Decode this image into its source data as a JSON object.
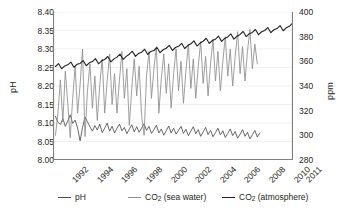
{
  "chart_data": {
    "type": "line",
    "title": "",
    "xlabel": "",
    "ylabel": "pH",
    "ylabel_right": "ppm",
    "ylim": [
      8.0,
      8.4
    ],
    "ylim_right": [
      280,
      400
    ],
    "xlim": [
      1991.5,
      2011.0
    ],
    "grid": true,
    "legend_position": "bottom",
    "xticks": [
      "1992",
      "1994",
      "1996",
      "1998",
      "2000",
      "2002",
      "2004",
      "2006",
      "2008",
      "2010",
      "2011"
    ],
    "xtick_values": [
      1992,
      1994,
      1996,
      1998,
      2000,
      2002,
      2004,
      2006,
      2008,
      2010,
      2011
    ],
    "yticks_left": [
      "8.00",
      "8.05",
      "8.10",
      "8.15",
      "8.20",
      "8.25",
      "8.30",
      "8.35",
      "8.40"
    ],
    "ytick_values_left": [
      8.0,
      8.05,
      8.1,
      8.15,
      8.2,
      8.25,
      8.3,
      8.35,
      8.4
    ],
    "yticks_right": [
      "280",
      "300",
      "320",
      "340",
      "360",
      "380",
      "400"
    ],
    "ytick_values_right": [
      280,
      300,
      320,
      340,
      360,
      380,
      400
    ],
    "series": [
      {
        "name": "pH",
        "axis": "left",
        "color": "#4d4d4d",
        "x": [
          1991.7,
          1991.9,
          1992.1,
          1992.3,
          1992.5,
          1992.7,
          1992.9,
          1993.1,
          1993.3,
          1993.5,
          1993.7,
          1993.9,
          1994.1,
          1994.3,
          1994.5,
          1994.7,
          1994.9,
          1995.1,
          1995.3,
          1995.5,
          1995.7,
          1995.9,
          1996.1,
          1996.3,
          1996.5,
          1996.7,
          1996.9,
          1997.1,
          1997.3,
          1997.5,
          1997.7,
          1997.9,
          1998.1,
          1998.3,
          1998.5,
          1998.7,
          1998.9,
          1999.1,
          1999.3,
          1999.5,
          1999.7,
          1999.9,
          2000.1,
          2000.3,
          2000.5,
          2000.7,
          2000.9,
          2001.1,
          2001.3,
          2001.5,
          2001.7,
          2001.9,
          2002.1,
          2002.3,
          2002.5,
          2002.7,
          2002.9,
          2003.1,
          2003.3,
          2003.5,
          2003.7,
          2003.9,
          2004.1,
          2004.3,
          2004.5,
          2004.7,
          2004.9,
          2005.1,
          2005.3,
          2005.5,
          2005.7,
          2005.9,
          2006.1,
          2006.3,
          2006.5,
          2006.7,
          2006.9,
          2007.1,
          2007.3,
          2007.5,
          2007.7,
          2007.9,
          2008.1,
          2008.3
        ],
        "values": [
          8.118,
          8.102,
          8.096,
          8.112,
          8.091,
          8.105,
          8.122,
          8.099,
          8.108,
          8.086,
          8.052,
          8.088,
          8.116,
          8.103,
          8.09,
          8.078,
          8.093,
          8.081,
          8.097,
          8.074,
          8.086,
          8.1,
          8.078,
          8.091,
          8.073,
          8.086,
          8.097,
          8.079,
          8.088,
          8.071,
          8.083,
          8.095,
          8.076,
          8.09,
          8.075,
          8.086,
          8.098,
          8.08,
          8.091,
          8.072,
          8.082,
          8.094,
          8.073,
          8.084,
          8.067,
          8.079,
          8.092,
          8.073,
          8.086,
          8.07,
          8.08,
          8.091,
          8.072,
          8.083,
          8.066,
          8.078,
          8.09,
          8.071,
          8.082,
          8.064,
          8.076,
          8.088,
          8.069,
          8.08,
          8.063,
          8.074,
          8.086,
          8.068,
          8.079,
          8.061,
          8.072,
          8.084,
          8.066,
          8.077,
          8.059,
          8.07,
          8.082,
          8.064,
          8.075,
          8.057,
          8.068,
          8.08,
          8.062,
          8.073
        ]
      },
      {
        "name": "CO2 (sea water)",
        "axis": "right",
        "color": "#8c8c8c",
        "x": [
          1991.7,
          1991.9,
          1992.1,
          1992.3,
          1992.5,
          1992.7,
          1992.9,
          1993.1,
          1993.3,
          1993.5,
          1993.7,
          1993.9,
          1994.1,
          1994.3,
          1994.5,
          1994.7,
          1994.9,
          1995.1,
          1995.3,
          1995.5,
          1995.7,
          1995.9,
          1996.1,
          1996.3,
          1996.5,
          1996.7,
          1996.9,
          1997.1,
          1997.3,
          1997.5,
          1997.7,
          1997.9,
          1998.1,
          1998.3,
          1998.5,
          1998.7,
          1998.9,
          1999.1,
          1999.3,
          1999.5,
          1999.7,
          1999.9,
          2000.1,
          2000.3,
          2000.5,
          2000.7,
          2000.9,
          2001.1,
          2001.3,
          2001.5,
          2001.7,
          2001.9,
          2002.1,
          2002.3,
          2002.5,
          2002.7,
          2002.9,
          2003.1,
          2003.3,
          2003.5,
          2003.7,
          2003.9,
          2004.1,
          2004.3,
          2004.5,
          2004.7,
          2004.9,
          2005.1,
          2005.3,
          2005.5,
          2005.7,
          2005.9,
          2006.1,
          2006.3,
          2006.5,
          2006.7,
          2006.9,
          2007.1,
          2007.3,
          2007.5,
          2007.7,
          2007.9,
          2008.1
        ],
        "values": [
          300,
          318,
          345,
          311,
          352,
          326,
          298,
          330,
          356,
          318,
          341,
          370,
          299,
          336,
          358,
          322,
          348,
          312,
          341,
          362,
          318,
          344,
          366,
          325,
          350,
          318,
          345,
          368,
          330,
          354,
          308,
          338,
          362,
          332,
          356,
          316,
          300,
          348,
          368,
          330,
          354,
          372,
          318,
          346,
          366,
          334,
          358,
          322,
          350,
          370,
          336,
          360,
          326,
          352,
          374,
          338,
          362,
          330,
          356,
          376,
          342,
          364,
          332,
          358,
          378,
          344,
          368,
          336,
          360,
          380,
          348,
          370,
          340,
          364,
          384,
          350,
          372,
          344,
          368,
          386,
          354,
          374,
          358
        ]
      },
      {
        "name": "CO2 (atmosphere)",
        "axis": "right",
        "color": "#231f20",
        "x": [
          1991.7,
          1991.95,
          1992.2,
          1992.45,
          1992.7,
          1992.95,
          1993.2,
          1993.45,
          1993.7,
          1993.95,
          1994.2,
          1994.45,
          1994.7,
          1994.95,
          1995.2,
          1995.45,
          1995.7,
          1995.95,
          1996.2,
          1996.45,
          1996.7,
          1996.95,
          1997.2,
          1997.45,
          1997.7,
          1997.95,
          1998.2,
          1998.45,
          1998.7,
          1998.95,
          1999.2,
          1999.45,
          1999.7,
          1999.95,
          2000.2,
          2000.45,
          2000.7,
          2000.95,
          2001.2,
          2001.45,
          2001.7,
          2001.95,
          2002.2,
          2002.45,
          2002.7,
          2002.95,
          2003.2,
          2003.45,
          2003.7,
          2003.95,
          2004.2,
          2004.45,
          2004.7,
          2004.95,
          2005.2,
          2005.45,
          2005.7,
          2005.95,
          2006.2,
          2006.45,
          2006.7,
          2006.95,
          2007.2,
          2007.45,
          2007.7,
          2007.95,
          2008.2,
          2008.45,
          2008.7,
          2008.95,
          2009.2,
          2009.45,
          2009.7,
          2009.95,
          2010.2,
          2010.45,
          2010.7,
          2010.95
        ],
        "values": [
          355.8,
          358.2,
          354.0,
          356.3,
          357.2,
          359.4,
          355.2,
          357.6,
          358.3,
          360.6,
          356.4,
          358.8,
          359.8,
          362.2,
          358.0,
          360.4,
          361.5,
          363.9,
          359.6,
          362.0,
          363.4,
          365.8,
          361.5,
          364.0,
          365.8,
          368.2,
          364.0,
          366.4,
          367.4,
          369.8,
          365.6,
          368.0,
          368.8,
          371.2,
          367.0,
          369.4,
          370.6,
          373.0,
          368.8,
          371.2,
          372.2,
          374.6,
          370.4,
          372.8,
          374.2,
          376.6,
          372.4,
          374.8,
          376.3,
          378.7,
          374.5,
          376.9,
          378.0,
          380.4,
          376.2,
          378.6,
          379.8,
          382.2,
          378.0,
          380.4,
          381.8,
          384.2,
          380.0,
          382.4,
          383.4,
          385.8,
          381.6,
          384.0,
          385.0,
          387.4,
          383.2,
          385.6,
          386.6,
          389.0,
          384.8,
          387.2,
          388.4,
          390.8
        ]
      }
    ]
  },
  "legend": {
    "items": [
      {
        "label_main": "pH",
        "label_sub": "",
        "label_tail": "",
        "color": "#4d4d4d"
      },
      {
        "label_main": "CO",
        "label_sub": "2",
        "label_tail": " (sea water)",
        "color": "#8c8c8c"
      },
      {
        "label_main": "CO",
        "label_sub": "2",
        "label_tail": " (atmosphere)",
        "color": "#231f20"
      }
    ]
  }
}
